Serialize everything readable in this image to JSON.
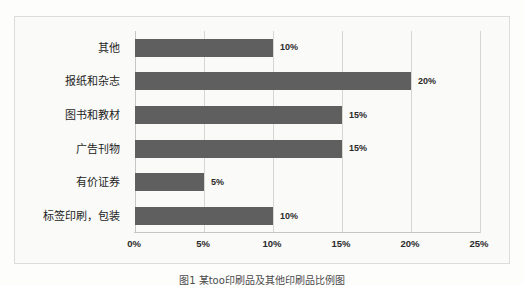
{
  "chart_data": {
    "type": "bar",
    "orientation": "horizontal",
    "title": "",
    "xlabel": "",
    "ylabel": "",
    "categories": [
      "其他",
      "报纸和杂志",
      "图书和教材",
      "广告刊物",
      "有价证券",
      "标签印刷，包装"
    ],
    "values": [
      10,
      20,
      15,
      15,
      5,
      10
    ],
    "data_labels": [
      "10%",
      "20%",
      "15%",
      "15%",
      "5%",
      "10%"
    ],
    "xlim": [
      0,
      25
    ],
    "xticks": [
      0,
      5,
      10,
      15,
      20,
      25
    ],
    "xticklabels": [
      "0%",
      "5%",
      "10%",
      "15%",
      "20%",
      "25%"
    ],
    "grid": "vertical",
    "legend": "none",
    "bar_color": "#5f5f5f",
    "plot_background": "#fafaf8",
    "gridline_color": "#d6d6d2",
    "border_color": "#dcdcd8"
  },
  "caption": {
    "text": "图1  某too印刷品及其他印刷品比例图"
  }
}
